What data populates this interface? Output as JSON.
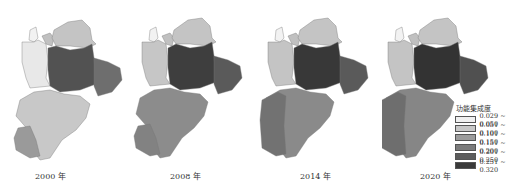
{
  "maps": [
    {
      "year_label": "2000 年",
      "fills": {
        "nw": "#e8e8e8",
        "nw2": "#f2f2f2",
        "north": "#c4c4c4",
        "center": "#525252",
        "east": "#6e6e6e",
        "south": "#c8c8c8",
        "sw": "#9a9a9a",
        "ne": "#c0c0c0"
      }
    },
    {
      "year_label": "2008 年",
      "fills": {
        "nw": "#c6c6c6",
        "nw2": "#f2f2f2",
        "north": "#c4c4c4",
        "center": "#3e3e3e",
        "east": "#5a5a5a",
        "south": "#8c8c8c",
        "sw": "#828282",
        "ne": "#c0c0c0"
      }
    },
    {
      "year_label": "2014 年",
      "fills": {
        "nw": "#c4c4c4",
        "nw2": "#f2f2f2",
        "north": "#c4c4c4",
        "center": "#383838",
        "east": "#5a5a5a",
        "south": "#8a8a8a",
        "sw": "#727272",
        "ne": "#c0c0c0"
      }
    },
    {
      "year_label": "2020 年",
      "fills": {
        "nw": "#c4c4c4",
        "nw2": "#f2f2f2",
        "north": "#c4c4c4",
        "center": "#333333",
        "east": "#505050",
        "south": "#868686",
        "sw": "#6e6e6e",
        "ne": "#c0c0c0"
      }
    }
  ],
  "legend": {
    "title": "功能集成度",
    "items": [
      {
        "range": "0.029 ~ 0.050",
        "color": "#f0f0f0"
      },
      {
        "range": "0.051 ~ 0.100",
        "color": "#c8c8c8"
      },
      {
        "range": "0.101 ~ 0.150",
        "color": "#9c9c9c"
      },
      {
        "range": "0.151 ~ 0.200",
        "color": "#7c7c7c"
      },
      {
        "range": "0.201 ~ 0.250",
        "color": "#5c5c5c"
      },
      {
        "range": "0.251 ~ 0.320",
        "color": "#3a3a3a"
      }
    ]
  }
}
